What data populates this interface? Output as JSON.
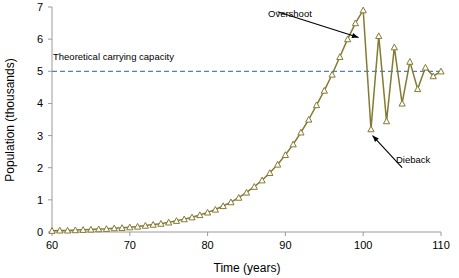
{
  "chart_data": {
    "type": "line",
    "title": "",
    "xlabel": "Time (years)",
    "ylabel": "Population (thousands)",
    "xlim": [
      60,
      110
    ],
    "ylim": [
      0,
      7
    ],
    "xticks": [
      60,
      70,
      80,
      90,
      100,
      110
    ],
    "yticks": [
      0,
      1,
      2,
      3,
      4,
      5,
      6,
      7
    ],
    "grid": false,
    "legend": false,
    "series": [
      {
        "name": "Population",
        "color": "#857a32",
        "marker": "triangle-open",
        "x": [
          60,
          61,
          62,
          63,
          64,
          65,
          66,
          67,
          68,
          69,
          70,
          71,
          72,
          73,
          74,
          75,
          76,
          77,
          78,
          79,
          80,
          81,
          82,
          83,
          84,
          85,
          86,
          87,
          88,
          89,
          90,
          91,
          92,
          93,
          94,
          95,
          96,
          97,
          98,
          99,
          100,
          101,
          102,
          103,
          104,
          105,
          106,
          107,
          108,
          109,
          110
        ],
        "values": [
          0.04,
          0.05,
          0.05,
          0.06,
          0.07,
          0.08,
          0.09,
          0.1,
          0.12,
          0.13,
          0.15,
          0.17,
          0.2,
          0.23,
          0.26,
          0.3,
          0.35,
          0.4,
          0.46,
          0.53,
          0.61,
          0.7,
          0.81,
          0.93,
          1.07,
          1.23,
          1.41,
          1.61,
          1.84,
          2.1,
          2.4,
          2.73,
          3.1,
          3.5,
          3.95,
          4.4,
          4.9,
          5.45,
          6.0,
          6.5,
          6.9,
          3.2,
          6.1,
          3.45,
          5.75,
          4.0,
          5.3,
          4.45,
          5.12,
          4.85,
          5.0
        ]
      }
    ],
    "reference_lines": [
      {
        "name": "Theoretical carrying capacity",
        "label": "Theoretical carrying capacity",
        "value": 5,
        "orientation": "horizontal",
        "style": "dashed",
        "color": "#4f81bd"
      }
    ],
    "annotations": [
      {
        "name": "overshoot",
        "text": "Overshoot",
        "point_x": 99.4,
        "point_y": 6.05,
        "label_x": 89.0,
        "label_y": 6.85
      },
      {
        "name": "dieback",
        "text": "Dieback",
        "point_x": 101.2,
        "point_y": 3.0,
        "label_x": 105.0,
        "label_y": 2.0
      }
    ]
  },
  "axes": {
    "x_title": "Time (years)",
    "y_title": "Population (thousands)",
    "x_tick_labels": [
      "60",
      "70",
      "80",
      "90",
      "100",
      "110"
    ],
    "y_tick_labels": [
      "0",
      "1",
      "2",
      "3",
      "4",
      "5",
      "6",
      "7"
    ]
  },
  "colors": {
    "series": "#857a32",
    "capacity": "#4f81bd",
    "axis": "#9a9a9a",
    "text": "#000000",
    "background": "#ffffff"
  }
}
